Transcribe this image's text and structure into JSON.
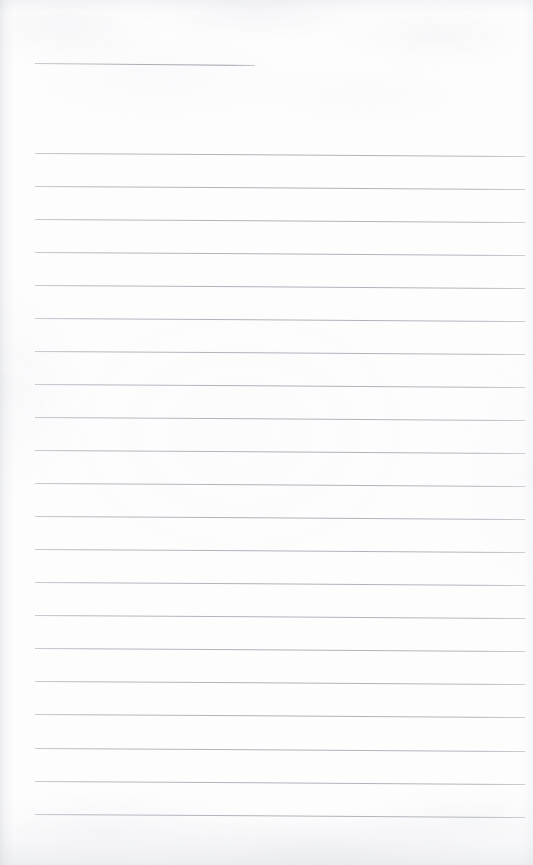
{
  "document": {
    "type": "scanned-ruled-page",
    "title_line": "",
    "body_text": "",
    "is_blank": true,
    "page_width": 533,
    "page_height": 865
  },
  "appearance": {
    "paper_color": "#fdfdfe",
    "rule_color": "#b5b9c0",
    "rule_color_dark": "#9aa0a8",
    "edge_shadow_color": "#acb1b8"
  },
  "ruling": {
    "left_margin_x": 35,
    "right_margin_x": 525,
    "header_rule": {
      "name": "header-underline",
      "x": 35,
      "y": 63,
      "width": 220,
      "slope_px": 2
    },
    "body_rule_start_y": 153,
    "body_rule_spacing": 33,
    "body_rule_count": 21,
    "body_rules": [
      {
        "index": 1,
        "y": 153,
        "slope_px": 3
      },
      {
        "index": 2,
        "y": 186,
        "slope_px": 3
      },
      {
        "index": 3,
        "y": 219,
        "slope_px": 3
      },
      {
        "index": 4,
        "y": 252,
        "slope_px": 3
      },
      {
        "index": 5,
        "y": 285,
        "slope_px": 3
      },
      {
        "index": 6,
        "y": 318,
        "slope_px": 3
      },
      {
        "index": 7,
        "y": 351,
        "slope_px": 3
      },
      {
        "index": 8,
        "y": 384,
        "slope_px": 3
      },
      {
        "index": 9,
        "y": 417,
        "slope_px": 3
      },
      {
        "index": 10,
        "y": 450,
        "slope_px": 3
      },
      {
        "index": 11,
        "y": 483,
        "slope_px": 3
      },
      {
        "index": 12,
        "y": 516,
        "slope_px": 3
      },
      {
        "index": 13,
        "y": 549,
        "slope_px": 3
      },
      {
        "index": 14,
        "y": 582,
        "slope_px": 3
      },
      {
        "index": 15,
        "y": 615,
        "slope_px": 3
      },
      {
        "index": 16,
        "y": 648,
        "slope_px": 3
      },
      {
        "index": 17,
        "y": 681,
        "slope_px": 3
      },
      {
        "index": 18,
        "y": 714,
        "slope_px": 3
      },
      {
        "index": 19,
        "y": 748,
        "slope_px": 3
      },
      {
        "index": 20,
        "y": 781,
        "slope_px": 3
      },
      {
        "index": 21,
        "y": 814,
        "slope_px": 3
      }
    ]
  }
}
